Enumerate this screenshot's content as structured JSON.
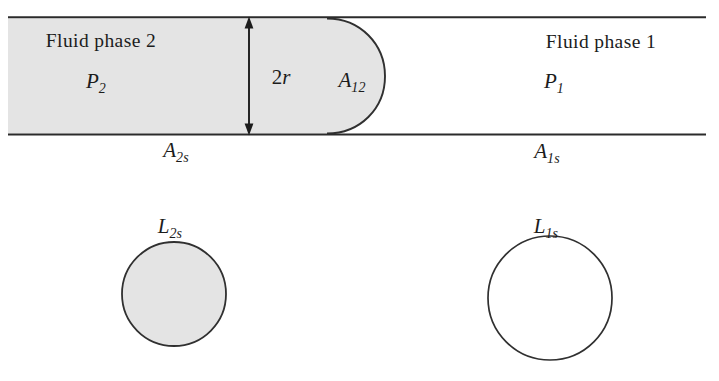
{
  "figure": {
    "kind": "capillary-tube-two-phase-diagram",
    "labels": {
      "fluid_phase_2": "Fluid phase 2",
      "fluid_phase_1": "Fluid phase 1",
      "pressure_2_base": "P",
      "pressure_2_sub": "2",
      "pressure_1_base": "P",
      "pressure_1_sub": "1",
      "diameter_base": "2",
      "diameter_var": "r",
      "interface_base": "A",
      "interface_sub": "12",
      "area_2s_base": "A",
      "area_2s_sub": "2s",
      "area_1s_base": "A",
      "area_1s_sub": "1s",
      "perimeter_2s_base": "L",
      "perimeter_2s_sub": "2s",
      "perimeter_1s_base": "L",
      "perimeter_1s_sub": "1s"
    },
    "colors": {
      "phase2_fill": "#e4e4e4",
      "phase1_fill": "#ffffff",
      "stroke": "#303030",
      "text": "#1c1c1c",
      "background": "#ffffff"
    },
    "geometry": {
      "tube_top_y": 17,
      "tube_bottom_y": 134,
      "tube_left_x": 10,
      "tube_right_x": 706,
      "meniscus_apex_x": 385,
      "meniscus_start_x": 327,
      "arrow_x": 249,
      "circle_left": {
        "cx": 174,
        "cy": 294,
        "r": 52,
        "filled": true
      },
      "circle_right": {
        "cx": 550,
        "cy": 298,
        "r": 62,
        "filled": false
      }
    }
  }
}
